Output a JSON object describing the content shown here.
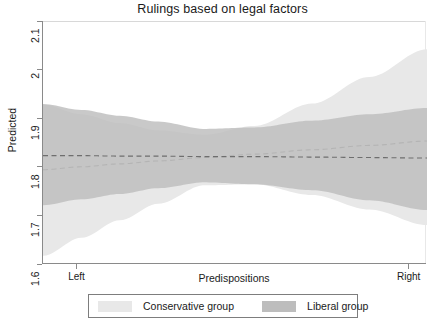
{
  "chart_data": {
    "type": "area",
    "title": "Rulings based on legal factors",
    "xlabel": "Predispositions",
    "ylabel": "Predicted",
    "grid": false,
    "legend_position": "bottom",
    "xlim": [
      0,
      1
    ],
    "ylim": [
      1.6,
      2.1
    ],
    "ytick_labels": [
      "1.6",
      "1.7",
      "1.8",
      "1.9",
      "2",
      "2.1"
    ],
    "ytick_values": [
      1.6,
      1.7,
      1.8,
      1.9,
      2.0,
      2.1
    ],
    "xtick_labels": [
      "Left",
      "Right"
    ],
    "xtick_values": [
      0.09,
      0.955
    ],
    "series": [
      {
        "name": "Conservative group",
        "color": "#e8e8e8",
        "style": "confidence-band-with-dashed-fit",
        "line_color": "#b4b4b4",
        "x": [
          0.0,
          0.1,
          0.2,
          0.3,
          0.42,
          0.55,
          0.7,
          0.85,
          1.0
        ],
        "fit": [
          1.794,
          1.8,
          1.806,
          1.812,
          1.819,
          1.826,
          1.835,
          1.844,
          1.853
        ],
        "upper": [
          1.928,
          1.908,
          1.89,
          1.875,
          1.866,
          1.884,
          1.93,
          1.985,
          2.042
        ],
        "lower": [
          1.617,
          1.654,
          1.69,
          1.724,
          1.762,
          1.764,
          1.742,
          1.712,
          1.68
        ]
      },
      {
        "name": "Liberal group",
        "color": "#bdbdbd",
        "style": "confidence-band-with-dashed-fit",
        "line_color": "#6e6e6e",
        "x": [
          0.0,
          0.1,
          0.2,
          0.3,
          0.42,
          0.55,
          0.7,
          0.85,
          1.0
        ],
        "fit": [
          1.823,
          1.823,
          1.822,
          1.822,
          1.821,
          1.821,
          1.82,
          1.819,
          1.818
        ],
        "upper": [
          1.929,
          1.917,
          1.905,
          1.893,
          1.878,
          1.881,
          1.895,
          1.908,
          1.921
        ],
        "lower": [
          1.721,
          1.733,
          1.744,
          1.756,
          1.768,
          1.764,
          1.752,
          1.731,
          1.711
        ]
      }
    ],
    "annotations": []
  },
  "legend": {
    "items": [
      {
        "label": "Conservative group",
        "swatch_color": "#e8e8e8"
      },
      {
        "label": "Liberal group",
        "swatch_color": "#bdbdbd"
      }
    ]
  },
  "axes": {
    "y": {
      "ticks": [
        {
          "label": "2.1",
          "value": 2.1
        },
        {
          "label": "2",
          "value": 2.0
        },
        {
          "label": "1.9",
          "value": 1.9
        },
        {
          "label": "1.8",
          "value": 1.8
        },
        {
          "label": "1.7",
          "value": 1.7
        },
        {
          "label": "1.6",
          "value": 1.6
        }
      ]
    },
    "x": {
      "ticks": [
        {
          "label": "Left",
          "value": 0.09
        },
        {
          "label": "Right",
          "value": 0.955
        }
      ]
    }
  },
  "colors": {
    "conservative_band": "#e8e8e8",
    "liberal_band": "#bdbdbd",
    "axis": "#8a8a8a",
    "text": "#1a1a1a",
    "background": "#ffffff"
  }
}
